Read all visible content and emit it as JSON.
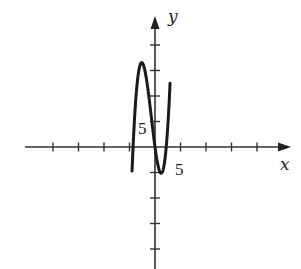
{
  "chart_data": {
    "type": "line",
    "title": "",
    "xlabel": "x",
    "ylabel": "y",
    "tick_step": 5,
    "x_tick_labels": [
      {
        "value": 5,
        "text": "5"
      }
    ],
    "y_tick_labels": [
      {
        "value": 5,
        "text": "5"
      }
    ],
    "xlim": [
      -25,
      27
    ],
    "ylim": [
      -24,
      25
    ],
    "x_ticks": [
      -20,
      -15,
      -10,
      -5,
      5,
      10,
      15,
      20
    ],
    "y_ticks": [
      -20,
      -15,
      -10,
      -5,
      5,
      10,
      15,
      20
    ],
    "grid": false,
    "legend": null,
    "series": [
      {
        "name": "cubic curve",
        "description": "Cubic polynomial, roots near x = -4.3, 0, 2.2; local max near (-2.5, 16.5); local min near (1, -5)",
        "roots": [
          -4.3,
          0,
          2.2
        ],
        "leading_coefficient": 0.78,
        "x_range": [
          -4.5,
          2.95
        ],
        "points": [
          {
            "x": -4.5,
            "y": -7.5
          },
          {
            "x": -4.3,
            "y": 0
          },
          {
            "x": -3.5,
            "y": 14.9
          },
          {
            "x": -2.5,
            "y": 16.5
          },
          {
            "x": -1.5,
            "y": 12.1
          },
          {
            "x": 0,
            "y": 0
          },
          {
            "x": 1,
            "y": -5.0
          },
          {
            "x": 2.2,
            "y": 0
          },
          {
            "x": 2.95,
            "y": 20.6
          }
        ],
        "color": "#1a1a1a"
      }
    ]
  },
  "labels": {
    "x_axis": "x",
    "y_axis": "y",
    "x_five": "5",
    "y_five": "5"
  }
}
